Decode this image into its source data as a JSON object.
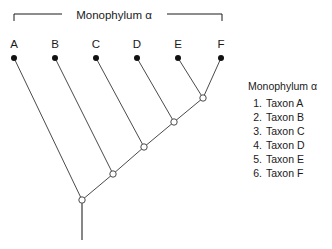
{
  "figure": {
    "title": "Monophylum α",
    "background": "#ffffff",
    "line_color": "#4a4a4a",
    "text_color": "#1a1a1a"
  },
  "header_bracket": {
    "label": "Monophylum α",
    "label_x": 114,
    "label_y": 19,
    "left_x": 14,
    "right_x": 222,
    "line_y": 14,
    "tick_drop": 7,
    "left_rule_end": 62,
    "right_rule_start": 167
  },
  "tips": [
    {
      "letter": "A",
      "label_x": 14,
      "label_y": 48,
      "dot_x": 14,
      "dot_y": 58,
      "parent": "n1"
    },
    {
      "letter": "B",
      "label_x": 55,
      "label_y": 48,
      "dot_x": 55,
      "dot_y": 58,
      "parent": "n2"
    },
    {
      "letter": "C",
      "label_x": 96,
      "label_y": 48,
      "dot_x": 96,
      "dot_y": 58,
      "parent": "n3"
    },
    {
      "letter": "D",
      "label_x": 137,
      "label_y": 48,
      "dot_x": 137,
      "dot_y": 58,
      "parent": "n4"
    },
    {
      "letter": "E",
      "label_x": 178,
      "label_y": 48,
      "dot_x": 178,
      "dot_y": 58,
      "parent": "n5"
    },
    {
      "letter": "F",
      "label_x": 221,
      "label_y": 48,
      "dot_x": 221,
      "dot_y": 58,
      "parent": "n5"
    }
  ],
  "nodes": [
    {
      "id": "n1",
      "x": 82,
      "y": 200,
      "r": 3.2
    },
    {
      "id": "n2",
      "x": 113,
      "y": 174,
      "r": 3.2
    },
    {
      "id": "n3",
      "x": 144,
      "y": 147,
      "r": 3.2
    },
    {
      "id": "n4",
      "x": 174,
      "y": 122,
      "r": 3.2
    },
    {
      "id": "n5",
      "x": 203,
      "y": 98,
      "r": 3.2
    }
  ],
  "backbone": [
    {
      "from": "n1",
      "to": "n2"
    },
    {
      "from": "n2",
      "to": "n3"
    },
    {
      "from": "n3",
      "to": "n4"
    },
    {
      "from": "n4",
      "to": "n5"
    }
  ],
  "root_stem": {
    "x": 82,
    "y_top": 200,
    "y_bottom": 240
  },
  "legend": {
    "title": "Monophylum α",
    "title_x": 248,
    "title_y": 90,
    "item_x": 262,
    "item_start_y": 107,
    "item_step": 14,
    "items": [
      {
        "number": "1.",
        "name": "Taxon A"
      },
      {
        "number": "2.",
        "name": "Taxon B"
      },
      {
        "number": "3.",
        "name": "Taxon C"
      },
      {
        "number": "4.",
        "name": "Taxon D"
      },
      {
        "number": "5.",
        "name": "Taxon E"
      },
      {
        "number": "6.",
        "name": "Taxon F"
      }
    ]
  },
  "chart_data": {
    "type": "diagram",
    "diagram_kind": "cladogram",
    "title": "Monophylum α",
    "taxa": [
      "Taxon A",
      "Taxon B",
      "Taxon C",
      "Taxon D",
      "Taxon E",
      "Taxon F"
    ],
    "tip_labels": [
      "A",
      "B",
      "C",
      "D",
      "E",
      "F"
    ],
    "topology": "(A,(B,(C,(D,(E,F)))))",
    "internal_node_count": 5,
    "shape": "ladderized pectinate (comb) tree",
    "node_style": "open circle",
    "tip_style": "filled circle",
    "has_root_stem": true,
    "bracket_spans_tips": [
      "A",
      "F"
    ]
  }
}
